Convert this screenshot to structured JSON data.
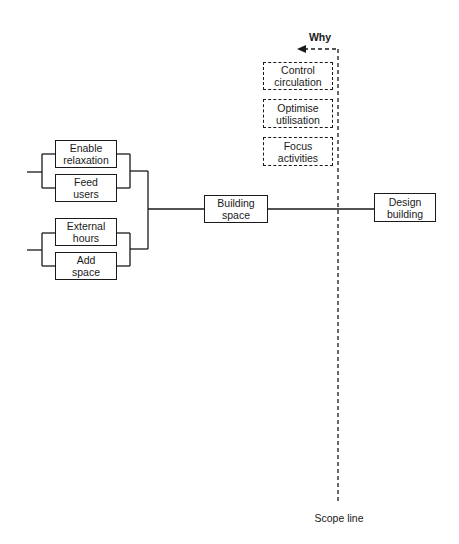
{
  "diagram": {
    "type": "FAST diagram (function analysis system technique)",
    "direction_label": "Why",
    "scope_label": "Scope line",
    "main_function": {
      "line1": "Design",
      "line2": "building"
    },
    "basic_function": {
      "line1": "Building",
      "line2": "space"
    },
    "scope_functions": [
      {
        "line1": "Control",
        "line2": "circulation"
      },
      {
        "line1": "Optimise",
        "line2": "utilisation"
      },
      {
        "line1": "Focus",
        "line2": "activities"
      }
    ],
    "secondary_functions": [
      {
        "line1": "Enable",
        "line2": "relaxation"
      },
      {
        "line1": "Feed",
        "line2": "users"
      },
      {
        "line1": "External",
        "line2": "hours"
      },
      {
        "line1": "Add",
        "line2": "space"
      }
    ]
  }
}
